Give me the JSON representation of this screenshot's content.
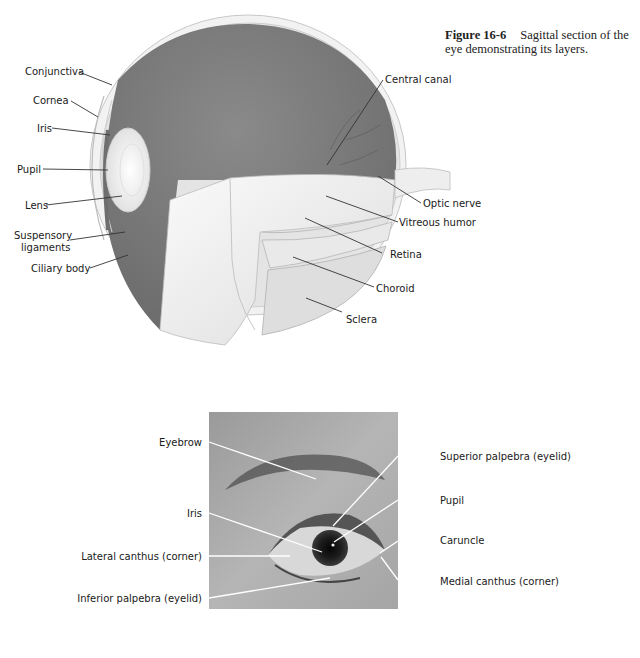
{
  "caption": {
    "figure_number": "Figure 16-6",
    "text": "Sagittal section of the eye demonstrating its layers."
  },
  "sagittal_diagram": {
    "labels_left": [
      {
        "id": "conjunctiva",
        "text": "Conjunctiva"
      },
      {
        "id": "cornea",
        "text": "Cornea"
      },
      {
        "id": "iris",
        "text": "Iris"
      },
      {
        "id": "pupil",
        "text": "Pupil"
      },
      {
        "id": "lens",
        "text": "Lens"
      },
      {
        "id": "suspensory-ligaments-1",
        "text": "Suspensory"
      },
      {
        "id": "suspensory-ligaments-2",
        "text": "ligaments"
      },
      {
        "id": "ciliary-body",
        "text": "Ciliary body"
      }
    ],
    "labels_right": [
      {
        "id": "central-canal",
        "text": "Central canal"
      },
      {
        "id": "optic-nerve",
        "text": "Optic nerve"
      },
      {
        "id": "vitreous-humor",
        "text": "Vitreous humor"
      },
      {
        "id": "retina",
        "text": "Retina"
      },
      {
        "id": "choroid",
        "text": "Choroid"
      },
      {
        "id": "sclera",
        "text": "Sclera"
      }
    ]
  },
  "external_eye_photo": {
    "labels_left": [
      {
        "id": "eyebrow",
        "text": "Eyebrow"
      },
      {
        "id": "iris",
        "text": "Iris"
      },
      {
        "id": "lateral-canthus",
        "text": "Lateral canthus (corner)"
      },
      {
        "id": "inferior-palpebra",
        "text": "Inferior palpebra (eyelid)"
      }
    ],
    "labels_right": [
      {
        "id": "superior-palpebra",
        "text": "Superior palpebra (eyelid)"
      },
      {
        "id": "pupil",
        "text": "Pupil"
      },
      {
        "id": "caruncle",
        "text": "Caruncle"
      },
      {
        "id": "medial-canthus",
        "text": "Medial canthus (corner)"
      }
    ]
  }
}
